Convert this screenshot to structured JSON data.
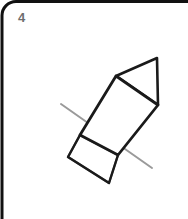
{
  "card": {
    "number_label": "4",
    "background_color": "#ffffff",
    "border_color": "#111111",
    "border_width": 3,
    "corner_radius": 14,
    "number_color": "#6e6e6e"
  },
  "figure": {
    "name": "rocket-line-drawing",
    "stroke_color": "#1a1a1a",
    "stroke_width": 2.6,
    "faint_stroke_color": "#9a9a9a",
    "faint_stroke_width": 2.0,
    "parts": {
      "nose_cone": {
        "name": "nose-cone-triangle",
        "points": "116,76 157,58 158,105"
      },
      "body": {
        "name": "rocket-body-quad",
        "points": "116,76 158,105 118,155 80,135"
      },
      "fin": {
        "name": "fin-quad",
        "points": "80,135 118,155 109,183 68,157"
      },
      "construction_line": {
        "name": "construction-line",
        "x1": 61,
        "y1": 104,
        "x2": 152,
        "y2": 168
      }
    }
  }
}
